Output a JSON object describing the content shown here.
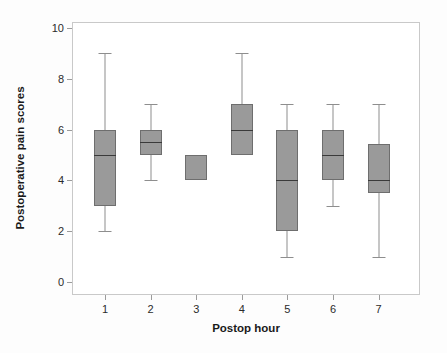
{
  "chart_data": {
    "type": "box",
    "title": "",
    "xlabel": "Postop hour",
    "ylabel": "Postoperative pain scores",
    "categories": [
      "1",
      "2",
      "3",
      "4",
      "5",
      "6",
      "7"
    ],
    "ylim": [
      0,
      10
    ],
    "yticks": [
      0,
      2,
      4,
      6,
      8,
      10
    ],
    "ytick_labels": [
      "0",
      "2",
      "4",
      "6",
      "8",
      "10"
    ],
    "grid": false,
    "legend": null,
    "box_fill_color": "#9a9a9a",
    "box_edge_color": "#6e6e6e",
    "median_color": "#3a3a3a",
    "whisker_color": "#8e8e8e",
    "boxes": [
      {
        "category": "1",
        "whisker_low": 2,
        "q1": 3,
        "median": 5,
        "q3": 6,
        "whisker_high": 9
      },
      {
        "category": "2",
        "whisker_low": 4,
        "q1": 5,
        "median": 5.5,
        "q3": 6,
        "whisker_high": 7
      },
      {
        "category": "3",
        "whisker_low": 4,
        "q1": 4,
        "median": null,
        "q3": 5,
        "whisker_high": 5
      },
      {
        "category": "4",
        "whisker_low": 5,
        "q1": 5,
        "median": 6,
        "q3": 7,
        "whisker_high": 9
      },
      {
        "category": "5",
        "whisker_low": 1,
        "q1": 2,
        "median": 4,
        "q3": 6,
        "whisker_high": 7
      },
      {
        "category": "6",
        "whisker_low": 3,
        "q1": 4,
        "median": 5,
        "q3": 6,
        "whisker_high": 7
      },
      {
        "category": "7",
        "whisker_low": 1,
        "q1": 3.5,
        "median": 4,
        "q3": 5.45,
        "whisker_high": 7
      }
    ]
  }
}
